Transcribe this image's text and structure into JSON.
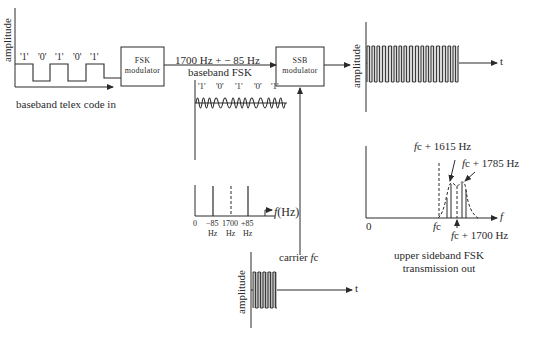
{
  "colors": {
    "ink": "#2a2a2a",
    "background": "#ffffff"
  },
  "input_signal": {
    "axis_label": "amplitude",
    "bits": [
      "'1'",
      "'0'",
      "'1'",
      "'0'",
      "'1'"
    ],
    "caption": "baseband telex code in"
  },
  "fsk_modulator": {
    "line1": "FSK",
    "line2": "modulator"
  },
  "baseband_fsk": {
    "label_line1": "1700 Hz + − 85 Hz",
    "label_line2": "baseband FSK",
    "bits": [
      "'1'",
      "'0'",
      "'1'",
      "'0'",
      "'1'"
    ]
  },
  "baseband_spectrum": {
    "axis_label_f": "f",
    "axis_label_unit": "(Hz)",
    "ticks": [
      {
        "top": "0",
        "bottom": ""
      },
      {
        "top": "−85",
        "bottom": "Hz"
      },
      {
        "top": "1700",
        "bottom": "Hz"
      },
      {
        "top": "+85",
        "bottom": "Hz"
      }
    ]
  },
  "ssb_modulator": {
    "line1": "SSB",
    "line2": "modulator"
  },
  "carrier": {
    "label_prefix": "carrier ",
    "label_symbol": "f",
    "label_suffix": "c",
    "axis_label": "amplitude",
    "time_label": "t"
  },
  "output_signal": {
    "axis_label": "amplitude",
    "time_label": "t"
  },
  "output_spectrum": {
    "origin_label": "0",
    "freq_axis_label": "f",
    "fc_label": "fc",
    "annotations": [
      {
        "f": "f",
        "text": "c + 1615 Hz"
      },
      {
        "f": "f",
        "text": "c + 1785 Hz"
      },
      {
        "f": "f",
        "text": "c + 1700 Hz"
      }
    ],
    "caption_line1": "upper sideband FSK",
    "caption_line2": "transmission out"
  }
}
